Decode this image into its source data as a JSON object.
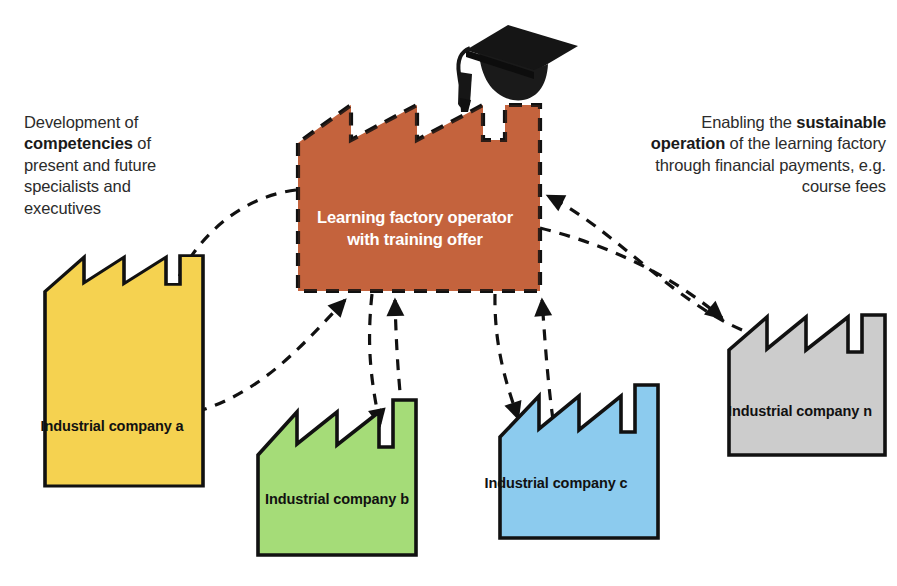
{
  "diagram": {
    "background_color": "#ffffff",
    "stroke_color": "#111111",
    "annotations": {
      "left": {
        "name": "competency-development-note",
        "pre": "Development of ",
        "emphasis": "competencies",
        "post": " of present and future specialists and executives",
        "full_text": "Development of competencies of present and future specialists and executives",
        "align": "left"
      },
      "right": {
        "name": "sustainable-operation-note",
        "pre": "Enabling the ",
        "emphasis": "sustainable operation",
        "post": " of the learning factory through financial payments, e.g. course fees",
        "full_text": "Enabling the sustainable operation of the learning factory through financial payments, e.g. course fees",
        "align": "right"
      }
    },
    "nodes": [
      {
        "id": "center",
        "name": "learning-factory-operator-node",
        "label": "Learning factory operator with training offer",
        "fill": "#C8663F",
        "text_color": "#FFFFFF",
        "border_style": "dashed",
        "icon": "graduation-cap-icon"
      },
      {
        "id": "company-a",
        "name": "industrial-company-a-node",
        "label": "Industrial company a",
        "fill": "#F5D250",
        "text_color": "#111111",
        "border_style": "solid"
      },
      {
        "id": "company-b",
        "name": "industrial-company-b-node",
        "label": "Industrial company b",
        "fill": "#A5DC78",
        "text_color": "#111111",
        "border_style": "solid"
      },
      {
        "id": "company-c",
        "name": "industrial-company-c-node",
        "label": "Industrial company c",
        "fill": "#8CCBEE",
        "text_color": "#111111",
        "border_style": "solid"
      },
      {
        "id": "company-n",
        "name": "industrial-company-n-node",
        "label": "Industrial company n",
        "fill": "#CCCCCC",
        "text_color": "#111111",
        "border_style": "solid"
      }
    ],
    "connectors": [
      {
        "name": "connector-center-to-company-a",
        "from": "center",
        "to": "company-a",
        "style": "dashed",
        "arrow": "end"
      },
      {
        "name": "connector-company-a-to-center",
        "from": "company-a",
        "to": "center",
        "style": "dashed",
        "arrow": "end"
      },
      {
        "name": "connector-center-to-company-b",
        "from": "center",
        "to": "company-b",
        "style": "dashed",
        "arrow": "end"
      },
      {
        "name": "connector-company-b-to-center",
        "from": "company-b",
        "to": "center",
        "style": "dashed",
        "arrow": "end"
      },
      {
        "name": "connector-center-to-company-c",
        "from": "center",
        "to": "company-c",
        "style": "dashed",
        "arrow": "end"
      },
      {
        "name": "connector-company-c-to-center",
        "from": "company-c",
        "to": "center",
        "style": "dashed",
        "arrow": "end"
      },
      {
        "name": "connector-center-to-company-n",
        "from": "center",
        "to": "company-n",
        "style": "dashed",
        "arrow": "end"
      },
      {
        "name": "connector-company-n-to-center",
        "from": "company-n",
        "to": "center",
        "style": "dashed",
        "arrow": "end"
      }
    ]
  }
}
